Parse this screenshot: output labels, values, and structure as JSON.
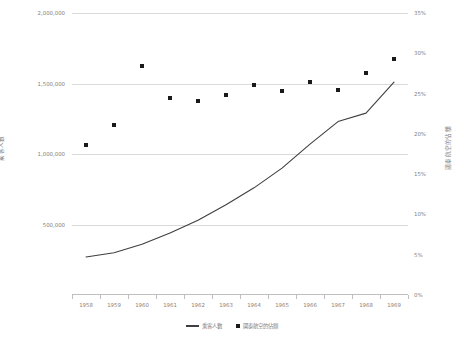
{
  "chart_data": {
    "type": "line",
    "title": "",
    "subtitle": "",
    "xlabel": "",
    "ylabel": "乘客人數",
    "ylabel_secondary": "國泰航空的佔額",
    "grid": true,
    "legend_position": "bottom",
    "categories": [
      "1958",
      "1959",
      "1960",
      "1961",
      "1962",
      "1963",
      "1964",
      "1965",
      "1966",
      "1967",
      "1968",
      "1969"
    ],
    "axes": {
      "left": {
        "label": "乘客人數",
        "min": 0,
        "max": 2000000,
        "ticks": [
          0,
          500000,
          1000000,
          1500000,
          2000000
        ],
        "tick_labels": [
          "",
          "500,000",
          "1,000,000",
          "1,500,000",
          "2,000,000"
        ]
      },
      "right": {
        "label": "國泰航空的佔額",
        "min": 0,
        "max": 35,
        "unit": "%",
        "ticks": [
          0,
          5,
          10,
          15,
          20,
          25,
          30,
          35
        ],
        "tick_labels": [
          "0%",
          "5%",
          "10%",
          "15%",
          "20%",
          "25%",
          "30%",
          "35%"
        ]
      }
    },
    "series": [
      {
        "name": "乘客人數",
        "type": "line",
        "axis": "left",
        "color": "#3f3f3f",
        "values": [
          270000,
          300000,
          360000,
          440000,
          530000,
          640000,
          760000,
          900000,
          1070000,
          1230000,
          1290000,
          1510000
        ]
      },
      {
        "name": "國泰航空的佔額",
        "type": "scatter",
        "axis": "right",
        "color": "#1a1a1a",
        "unit": "%",
        "values": [
          18.6,
          21.1,
          28.4,
          24.4,
          24.1,
          24.8,
          26.1,
          25.3,
          26.4,
          25.4,
          27.5,
          29.3
        ]
      }
    ],
    "legend": [
      {
        "name": "乘客人數",
        "marker": "line"
      },
      {
        "name": "國泰航空的佔額",
        "marker": "square"
      }
    ]
  }
}
